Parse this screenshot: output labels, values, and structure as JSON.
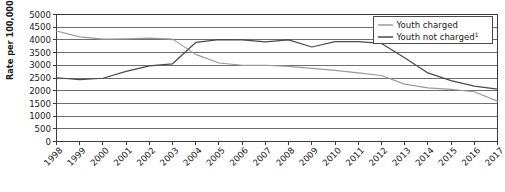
{
  "chart_data": {
    "type": "line",
    "title": "",
    "xlabel": "",
    "ylabel": "Rate per 100,000 youth",
    "ylim": [
      0,
      5000
    ],
    "ytick_step": 500,
    "yticks": [
      "0",
      "500",
      "1000",
      "1500",
      "2000",
      "2500",
      "3000",
      "3500",
      "4000",
      "4500",
      "5000"
    ],
    "grid": true,
    "legend_position": "top-right",
    "x": [
      1998,
      1999,
      2000,
      2001,
      2002,
      2003,
      2004,
      2005,
      2006,
      2007,
      2008,
      2009,
      2010,
      2011,
      2012,
      2013,
      2014,
      2015,
      2016,
      2017
    ],
    "categories": [
      "1998",
      "1999",
      "2000",
      "2001",
      "2002",
      "2003",
      "2004",
      "2005",
      "2006",
      "2007",
      "2008",
      "2009",
      "2010",
      "2011",
      "2012",
      "2013",
      "2014",
      "2015",
      "2016",
      "2017"
    ],
    "series": [
      {
        "name": "Youth charged",
        "color": "#9a9a9a",
        "values": [
          4350,
          4120,
          4030,
          4040,
          4070,
          4030,
          3430,
          3090,
          3000,
          3000,
          2960,
          2880,
          2800,
          2700,
          2600,
          2260,
          2110,
          2050,
          1960,
          1590
        ]
      },
      {
        "name": "Youth not charged",
        "color": "#4a4a4a",
        "footnote": "1",
        "values": [
          2510,
          2440,
          2490,
          2760,
          2980,
          3060,
          3900,
          4010,
          4000,
          3920,
          4000,
          3720,
          3930,
          3930,
          3860,
          3300,
          2700,
          2400,
          2180,
          2060
        ]
      }
    ],
    "legend": [
      {
        "label": "Youth charged",
        "footnote": "",
        "color": "#9a9a9a"
      },
      {
        "label": "Youth not charged",
        "footnote": "1",
        "color": "#4a4a4a"
      }
    ]
  }
}
